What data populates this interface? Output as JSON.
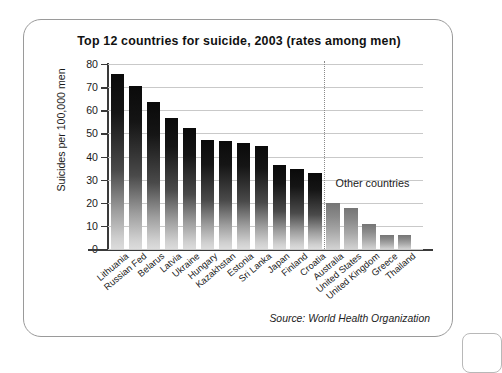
{
  "figure": {
    "title": "Top 12 countries for suicide, 2003 (rates among men)",
    "source": "Source: World Health Organization",
    "annotation": "Other countries"
  },
  "chart_data": {
    "type": "bar",
    "title": "Top 12 countries for suicide, 2003 (rates among men)",
    "xlabel": "",
    "ylabel": "Suicides per 100,000 men",
    "ylim": [
      0,
      80
    ],
    "yticks": [
      0,
      10,
      20,
      30,
      40,
      50,
      60,
      70,
      80
    ],
    "ytick_labels": [
      "0",
      "10",
      "20",
      "30",
      "40",
      "50",
      "60",
      "70",
      "80"
    ],
    "grid": true,
    "legend": false,
    "annotations": [
      "Other countries"
    ],
    "source": "Source: World Health Organization",
    "groups": [
      {
        "name": "Top 12 countries",
        "categories": [
          "Lithuania",
          "Russian Fed",
          "Belarus",
          "Latvia",
          "Ukraine",
          "Hungary",
          "Kazakhstan",
          "Estonia",
          "Sri Lanka",
          "Japan",
          "Finland",
          "Croatia"
        ],
        "values": [
          75.6,
          70.4,
          63.6,
          56.5,
          52.2,
          47.1,
          46.5,
          45.9,
          44.6,
          36.5,
          34.6,
          33.0
        ]
      },
      {
        "name": "Other countries",
        "categories": [
          "Australia",
          "United States",
          "United Kingdom",
          "Greece",
          "Thailand"
        ],
        "values": [
          20.1,
          17.9,
          11.0,
          6.0,
          5.9
        ]
      }
    ],
    "categories": [
      "Lithuania",
      "Russian Fed",
      "Belarus",
      "Latvia",
      "Ukraine",
      "Hungary",
      "Kazakhstan",
      "Estonia",
      "Sri Lanka",
      "Japan",
      "Finland",
      "Croatia",
      "Australia",
      "United States",
      "United Kingdom",
      "Greece",
      "Thailand"
    ],
    "values": [
      75.6,
      70.4,
      63.6,
      56.5,
      52.2,
      47.1,
      46.5,
      45.9,
      44.6,
      36.5,
      34.6,
      33.0,
      20.1,
      17.9,
      11.0,
      6.0,
      5.9
    ],
    "colors": {
      "bar_top": "#0a0a0a",
      "bar_bottom": "#dcdcdc",
      "bar_other_top": "#757575",
      "bar_other_bottom": "#d2d2d2",
      "gridline": "#c9c9c9",
      "axis": "#3a3a3a",
      "card_border": "#9a9a9a",
      "background": "#ffffff"
    }
  }
}
